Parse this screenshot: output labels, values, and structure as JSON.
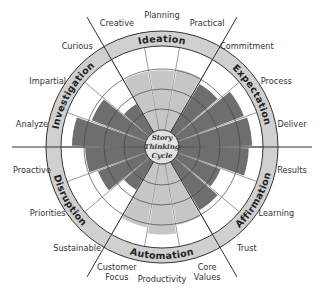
{
  "center_title": [
    "Story",
    "Thinking",
    "Cycle"
  ],
  "colors": {
    "light_wedge": "#c6c6c6",
    "dark_wedge": "#6e6e6e",
    "ring_fill": "#d0d0d0",
    "line": "#333333"
  },
  "categories": [
    {
      "name": "Ideation",
      "shade": "light",
      "items": [
        {
          "label": "Creative",
          "value": 72
        },
        {
          "label": "Planning",
          "value": 72
        },
        {
          "label": "Practical",
          "value": 75
        }
      ]
    },
    {
      "name": "Expectation",
      "shade": "dark",
      "items": [
        {
          "label": "Commitment",
          "value": 68
        },
        {
          "label": "Process",
          "value": 85
        },
        {
          "label": "Deliver",
          "value": 88
        }
      ]
    },
    {
      "name": "Affirmation",
      "shade": "dark",
      "items": [
        {
          "label": "Results",
          "value": 84
        },
        {
          "label": "Learning",
          "value": 55
        },
        {
          "label": "Trust",
          "value": 68
        }
      ]
    },
    {
      "name": "Automation",
      "shade": "light",
      "items": [
        {
          "label": "Core Values",
          "value": 75
        },
        {
          "label": "Productivity",
          "value": 85
        },
        {
          "label": "Customer Focus",
          "value": 78
        }
      ]
    },
    {
      "name": "Disruption",
      "shade": "dark",
      "items": [
        {
          "label": "Sustainable",
          "value": 40
        },
        {
          "label": "Priorities",
          "value": 62
        },
        {
          "label": "Proactive",
          "value": 72
        }
      ]
    },
    {
      "name": "Investigation",
      "shade": "dark",
      "items": [
        {
          "label": "Analyze",
          "value": 88
        },
        {
          "label": "Impartial",
          "value": 70
        },
        {
          "label": "Curious",
          "value": 40
        }
      ]
    }
  ]
}
